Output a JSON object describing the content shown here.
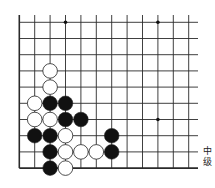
{
  "diagram": {
    "type": "go-board-corner",
    "corner": "lower-left",
    "columns": 12,
    "rows": 10,
    "origin_x": 19.3,
    "origin_y": 22.3,
    "spacing_x": 15.4,
    "spacing_y": 16.2,
    "line_color": "#2a2a2a",
    "star_points": [
      {
        "col": 3,
        "row": 0
      },
      {
        "col": 9,
        "row": 0
      },
      {
        "col": 9,
        "row": 6
      }
    ],
    "stones": [
      {
        "color": "white",
        "col": 2,
        "row": 3
      },
      {
        "color": "white",
        "col": 2,
        "row": 4
      },
      {
        "color": "white",
        "col": 1,
        "row": 5
      },
      {
        "color": "black",
        "col": 2,
        "row": 5
      },
      {
        "color": "black",
        "col": 3,
        "row": 5
      },
      {
        "color": "white",
        "col": 1,
        "row": 6
      },
      {
        "color": "white",
        "col": 2,
        "row": 6
      },
      {
        "color": "black",
        "col": 3,
        "row": 6
      },
      {
        "color": "black",
        "col": 4,
        "row": 6
      },
      {
        "color": "black",
        "col": 1,
        "row": 7
      },
      {
        "color": "black",
        "col": 2,
        "row": 7
      },
      {
        "color": "white",
        "col": 3,
        "row": 7
      },
      {
        "color": "black",
        "col": 6,
        "row": 7
      },
      {
        "color": "black",
        "col": 2,
        "row": 8
      },
      {
        "color": "white",
        "col": 3,
        "row": 8
      },
      {
        "color": "white",
        "col": 4,
        "row": 8
      },
      {
        "color": "white",
        "col": 5,
        "row": 8
      },
      {
        "color": "black",
        "col": 6,
        "row": 8
      },
      {
        "color": "black",
        "col": 2,
        "row": 9
      },
      {
        "color": "white",
        "col": 3,
        "row": 9
      }
    ]
  },
  "caption": {
    "line1": "中",
    "line2": "级"
  }
}
